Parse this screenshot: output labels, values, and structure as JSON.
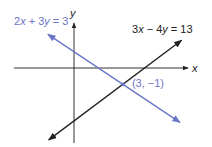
{
  "chart_data": {
    "type": "line",
    "title": "",
    "xlabel": "x",
    "ylabel": "y",
    "xlim": [
      -3.7,
      7.0
    ],
    "ylim": [
      -4.6,
      2.8
    ],
    "grid": false,
    "series": [
      {
        "name": "2x + 3y = 3",
        "equation": {
          "a": 2,
          "b": 3,
          "c": 3
        },
        "x_range": [
          -1.6,
          6.5
        ],
        "color": "#6b74c8",
        "label_parts": [
          "2",
          "x",
          " + 3",
          "y",
          " = 3"
        ]
      },
      {
        "name": "3x − 4y = 13",
        "equation": {
          "a": 3,
          "b": -4,
          "c": 13
        },
        "x_range": [
          -1.55,
          6.6
        ],
        "color": "#222222",
        "label_parts": [
          "3",
          "x",
          " − 4",
          "y",
          " = 13"
        ]
      }
    ],
    "annotations": [
      {
        "text": "(3, −1)",
        "x": 3,
        "y": -1,
        "color": "#6b74c8"
      }
    ]
  }
}
